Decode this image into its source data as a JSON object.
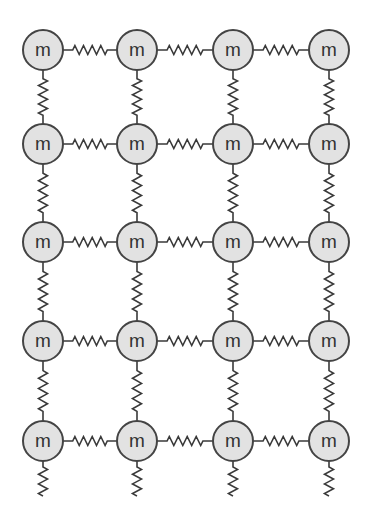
{
  "diagram": {
    "title": "",
    "type": "mass-spring lattice",
    "columns": 4,
    "rows": 5,
    "mass_label": "m",
    "column_x": [
      43,
      137,
      233,
      329
    ],
    "row_y": [
      50,
      144,
      242,
      341,
      441
    ],
    "mass_radius": 20,
    "dangling_spring_end_y": 496,
    "colors": {
      "mass_fill": "#e2e2e2",
      "mass_stroke": "#444444",
      "spring": "#3a3a3a",
      "label": "#333333",
      "background": "#ffffff"
    },
    "connections": {
      "horizontal_springs_per_row": 3,
      "vertical_springs_per_column": 4,
      "dangling_springs_below_bottom_row": 4
    }
  }
}
